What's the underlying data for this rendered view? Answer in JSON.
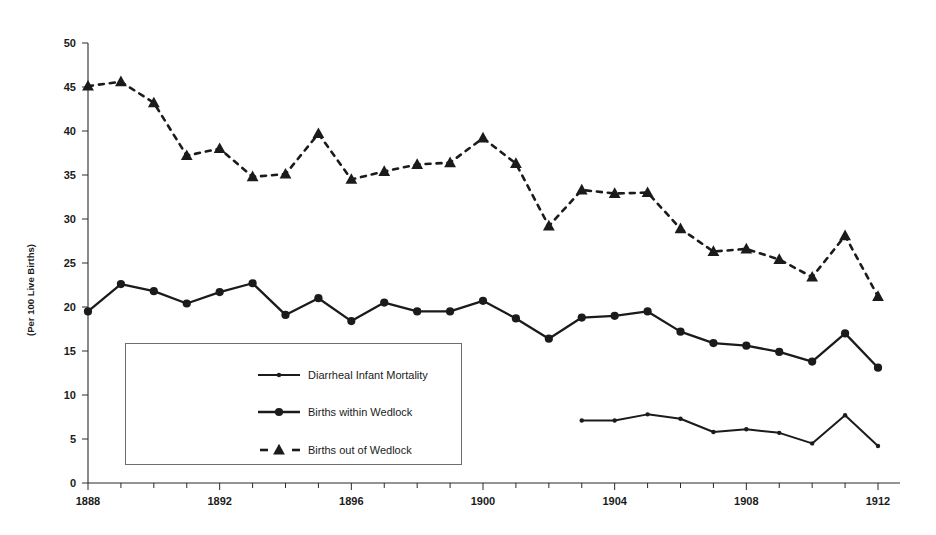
{
  "chart_data": {
    "type": "line",
    "title": "",
    "subtitle": "",
    "xlabel": "",
    "ylabel": "(Per 100 Live Births)",
    "xlim": [
      1888,
      1912
    ],
    "ylim": [
      0,
      50
    ],
    "ytick_step": 5,
    "yticks": [
      0,
      5,
      10,
      15,
      20,
      25,
      30,
      35,
      40,
      45,
      50
    ],
    "xticks_labeled": [
      1888,
      1892,
      1896,
      1900,
      1904,
      1908,
      1912
    ],
    "xtick_minor_step": 1,
    "grid": false,
    "legend_position": "inside-lower-left",
    "series": [
      {
        "name": "Diarrheal Infant Mortality",
        "marker": "small-circle",
        "line_style": "solid",
        "color": "#1b1b1b",
        "x": [
          1903,
          1904,
          1905,
          1906,
          1907,
          1908,
          1909,
          1910,
          1911,
          1912
        ],
        "values": [
          7.1,
          7.1,
          7.8,
          7.3,
          5.8,
          6.1,
          5.7,
          4.5,
          7.7,
          4.2
        ]
      },
      {
        "name": "Births within Wedlock",
        "marker": "large-circle",
        "line_style": "solid",
        "color": "#1b1b1b",
        "x": [
          1888,
          1889,
          1890,
          1891,
          1892,
          1893,
          1894,
          1895,
          1896,
          1897,
          1898,
          1899,
          1900,
          1901,
          1902,
          1903,
          1904,
          1905,
          1906,
          1907,
          1908,
          1909,
          1910,
          1911,
          1912
        ],
        "values": [
          19.5,
          22.6,
          21.8,
          20.4,
          21.7,
          22.7,
          19.1,
          21.0,
          18.4,
          20.5,
          19.5,
          19.5,
          20.7,
          18.7,
          16.4,
          18.8,
          19.0,
          19.5,
          17.2,
          15.9,
          15.6,
          14.9,
          13.8,
          17.0,
          13.1
        ]
      },
      {
        "name": "Births out of Wedlock",
        "marker": "triangle",
        "line_style": "dashed",
        "color": "#1b1b1b",
        "x": [
          1888,
          1889,
          1890,
          1891,
          1892,
          1893,
          1894,
          1895,
          1896,
          1897,
          1898,
          1899,
          1900,
          1901,
          1902,
          1903,
          1904,
          1905,
          1906,
          1907,
          1908,
          1909,
          1910,
          1911,
          1912
        ],
        "values": [
          45.1,
          45.6,
          43.2,
          37.2,
          38.0,
          34.8,
          35.1,
          39.7,
          34.5,
          35.4,
          36.2,
          36.4,
          39.2,
          36.3,
          29.2,
          33.3,
          32.9,
          33.0,
          28.9,
          26.3,
          26.6,
          25.4,
          23.4,
          28.1,
          21.2
        ]
      }
    ]
  },
  "legend": {
    "items": [
      {
        "label": "Diarrheal Infant Mortality",
        "marker": "small-circle",
        "line_style": "solid"
      },
      {
        "label": "Births within Wedlock",
        "marker": "large-circle",
        "line_style": "solid"
      },
      {
        "label": "Births out of Wedlock",
        "marker": "triangle",
        "line_style": "dashed"
      }
    ]
  },
  "axis": {
    "y_title": "(Per 100 Live Births)",
    "y_tick_labels": [
      "0",
      "5",
      "10",
      "15",
      "20",
      "25",
      "30",
      "35",
      "40",
      "45",
      "50"
    ],
    "x_tick_labels": [
      "1888",
      "1892",
      "1896",
      "1900",
      "1904",
      "1908",
      "1912"
    ]
  },
  "colors": {
    "ink": "#1b1b1b",
    "axis": "#2a2a2a",
    "legend_border": "#6e6e6e",
    "background": "#ffffff"
  }
}
